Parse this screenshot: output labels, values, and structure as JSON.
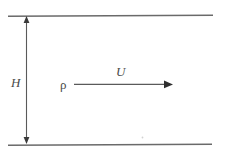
{
  "figure": {
    "type": "channel-flow-schematic",
    "background_color": "#ffffff",
    "line_color": "#6a6a6a",
    "text_color": "#4a4a4a"
  },
  "labels": {
    "height": "H",
    "density": "ρ",
    "velocity": "U"
  },
  "geometry": {
    "top_wall": {
      "x1": 8,
      "y1": 16,
      "x2": 213,
      "y2": 15
    },
    "bottom_wall": {
      "x1": 8,
      "y1": 145,
      "x2": 212,
      "y2": 144
    },
    "height_arrow": {
      "x": 26.5,
      "y_top": 16,
      "y_bottom": 144,
      "double_headed": true
    },
    "velocity_arrow": {
      "x_start": 74,
      "x_end": 172,
      "y": 84,
      "double_headed": false
    }
  },
  "icons": {
    "arrow_up": "arrow-up-icon",
    "arrow_down": "arrow-down-icon",
    "arrow_right": "arrow-right-icon"
  }
}
